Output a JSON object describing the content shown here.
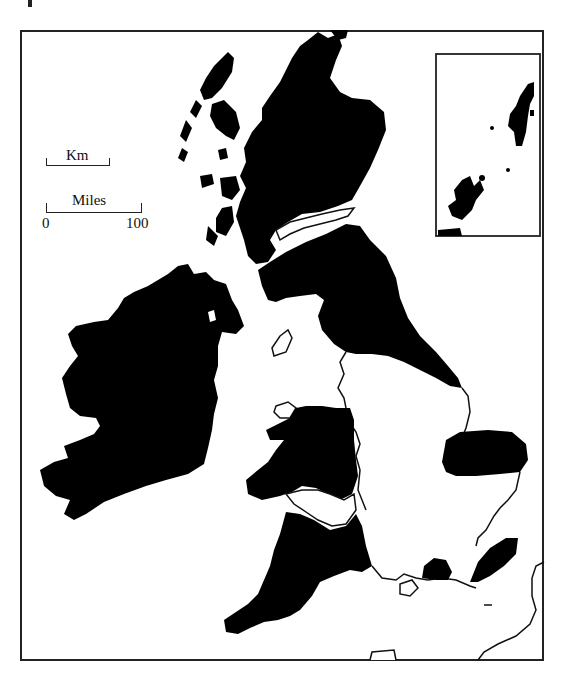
{
  "map": {
    "subject": "British Isles",
    "legend": {
      "fill_meaning": "shaded regions",
      "fill_color": "#000000",
      "unshaded_color": "#ffffff",
      "outline_color": "#111111"
    },
    "scale": {
      "km_label": "Km",
      "miles_label": "Miles",
      "tick_start": "0",
      "tick_end": "100"
    },
    "inset": {
      "depicts": "Northern Isles (Orkney and Shetland)"
    },
    "regions_shaded": [
      "Scotland (Highlands and Southern Uplands)",
      "Ireland",
      "Northern England (Pennines, Lake District, North York Moors)",
      "Wales",
      "South-West England",
      "East Anglia / Norfolk patch",
      "South-East chalk patches"
    ],
    "regions_unshaded": [
      "English Midlands and lowlands",
      "Scottish Central Belt lowland",
      "Isle of Man",
      "Anglesey",
      "Isle of Wight",
      "Northern France coast"
    ]
  }
}
